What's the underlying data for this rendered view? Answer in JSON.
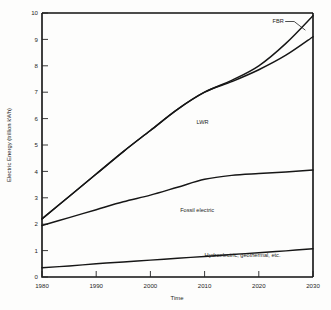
{
  "chart_data": {
    "type": "line",
    "title": "",
    "subtitle": "",
    "xlabel": "Time",
    "ylabel": "Electric Energy (trillion kWh)",
    "xlim": [
      1980,
      2030
    ],
    "ylim": [
      0,
      10
    ],
    "grid": false,
    "legend_position": "inline-annotations",
    "x_ticks": [
      "1980",
      "1990",
      "2000",
      "2010",
      "2020",
      "2030"
    ],
    "x_tick_values": [
      1980,
      1990,
      2000,
      2010,
      2020,
      2030
    ],
    "y_ticks": [
      "0",
      "1",
      "2",
      "3",
      "4",
      "5",
      "6",
      "7",
      "8",
      "9",
      "10"
    ],
    "y_tick_values": [
      0,
      1,
      2,
      3,
      4,
      5,
      6,
      7,
      8,
      9,
      10
    ],
    "x": [
      1980,
      1985,
      1990,
      1995,
      2000,
      2005,
      2010,
      2015,
      2020,
      2025,
      2030
    ],
    "series": [
      {
        "name": "FBR",
        "label": "FBR",
        "color": "#161616",
        "values": [
          2.2,
          3.05,
          3.9,
          4.75,
          5.55,
          6.35,
          7.0,
          7.45,
          8.0,
          8.85,
          9.9
        ]
      },
      {
        "name": "LWR",
        "label": "LWR",
        "color": "#161616",
        "values": [
          2.2,
          3.05,
          3.9,
          4.75,
          5.55,
          6.35,
          7.0,
          7.4,
          7.85,
          8.4,
          9.1
        ]
      },
      {
        "name": "Fossil electric",
        "label": "Fossil electric",
        "color": "#161616",
        "values": [
          1.95,
          2.25,
          2.55,
          2.85,
          3.1,
          3.4,
          3.7,
          3.85,
          3.92,
          3.98,
          4.05
        ]
      },
      {
        "name": "Hydroelectric, geothermal, etc.",
        "label": "Hydroelectric, geothermal, etc.",
        "color": "#161616",
        "values": [
          0.35,
          0.42,
          0.5,
          0.57,
          0.64,
          0.71,
          0.78,
          0.85,
          0.92,
          0.99,
          1.07
        ]
      }
    ],
    "annotations": [
      {
        "text": "FBR",
        "x": 2024.6,
        "y": 9.62,
        "leader": true
      },
      {
        "text": "LWR",
        "x": 2008.5,
        "y": 5.78,
        "leader": false
      },
      {
        "text": "Fossil electric",
        "x": 2005.5,
        "y": 2.45,
        "leader": false
      },
      {
        "text": "Hydroelectric, geothermal, etc.",
        "x": 2010.0,
        "y": 0.77,
        "leader": false
      }
    ]
  }
}
